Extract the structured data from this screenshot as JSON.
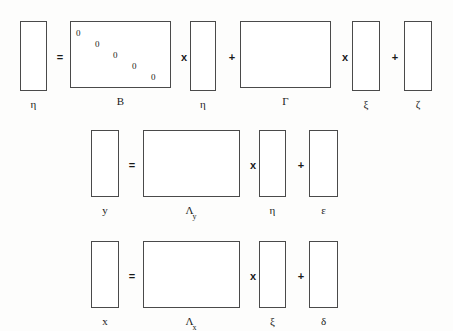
{
  "diagram": {
    "background_color": "#fdfdfc",
    "line_color": "#4a4a4a",
    "text_color": "#1a1a1a",
    "equations": [
      {
        "id": "structural",
        "expression": "η = Bη + Γξ + ζ",
        "terms": [
          {
            "kind": "vector",
            "label": "η",
            "sub": "",
            "x": 20,
            "y": 21,
            "w": 27,
            "h": 70
          },
          {
            "kind": "operator",
            "label": "=",
            "x": 54,
            "y": 52
          },
          {
            "kind": "matrix",
            "label": "B",
            "sub": "",
            "x": 70,
            "y": 21,
            "w": 101,
            "h": 67
          },
          {
            "kind": "operator",
            "label": "x",
            "x": 178,
            "y": 52
          },
          {
            "kind": "vector",
            "label": "η",
            "sub": "",
            "x": 190,
            "y": 21,
            "w": 26,
            "h": 70
          },
          {
            "kind": "operator",
            "label": "+",
            "x": 226,
            "y": 52
          },
          {
            "kind": "matrix",
            "label": "Γ",
            "sub": "",
            "x": 240,
            "y": 21,
            "w": 91,
            "h": 67
          },
          {
            "kind": "operator",
            "label": "x",
            "x": 339,
            "y": 52
          },
          {
            "kind": "vector",
            "label": "ξ",
            "sub": "",
            "x": 352,
            "y": 21,
            "w": 28,
            "h": 70
          },
          {
            "kind": "operator",
            "label": "+",
            "x": 389,
            "y": 52
          },
          {
            "kind": "vector",
            "label": "ζ",
            "sub": "",
            "x": 404,
            "y": 21,
            "w": 28,
            "h": 70
          }
        ],
        "matrix_zeros": {
          "note": "B has a descending diagonal of zeros (no self-influence)",
          "values": [
            "0",
            "0",
            "0",
            "0",
            "0"
          ],
          "positions": [
            {
              "x": 76,
              "y": 29
            },
            {
              "x": 95,
              "y": 40
            },
            {
              "x": 113,
              "y": 51
            },
            {
              "x": 132,
              "y": 62
            },
            {
              "x": 151,
              "y": 73
            }
          ]
        }
      },
      {
        "id": "measurement-y",
        "expression": "y = Λy η + ε",
        "terms": [
          {
            "kind": "vector",
            "label": "y",
            "sub": "",
            "x": 91,
            "y": 130,
            "w": 28,
            "h": 67
          },
          {
            "kind": "operator",
            "label": "=",
            "x": 126,
            "y": 160
          },
          {
            "kind": "matrix",
            "label": "Λ",
            "sub": "y",
            "x": 143,
            "y": 130,
            "w": 97,
            "h": 67
          },
          {
            "kind": "operator",
            "label": "x",
            "x": 247,
            "y": 160
          },
          {
            "kind": "vector",
            "label": "η",
            "sub": "",
            "x": 259,
            "y": 130,
            "w": 27,
            "h": 67
          },
          {
            "kind": "operator",
            "label": "+",
            "x": 295,
            "y": 160
          },
          {
            "kind": "vector",
            "label": "ε",
            "sub": "",
            "x": 309,
            "y": 130,
            "w": 29,
            "h": 67
          }
        ]
      },
      {
        "id": "measurement-x",
        "expression": "x = Λx ξ + δ",
        "terms": [
          {
            "kind": "vector",
            "label": "x",
            "sub": "",
            "x": 91,
            "y": 241,
            "w": 28,
            "h": 67
          },
          {
            "kind": "operator",
            "label": "=",
            "x": 126,
            "y": 271
          },
          {
            "kind": "matrix",
            "label": "Λ",
            "sub": "x",
            "x": 143,
            "y": 241,
            "w": 97,
            "h": 67
          },
          {
            "kind": "operator",
            "label": "x",
            "x": 247,
            "y": 271
          },
          {
            "kind": "vector",
            "label": "ξ",
            "sub": "",
            "x": 259,
            "y": 241,
            "w": 27,
            "h": 67
          },
          {
            "kind": "operator",
            "label": "+",
            "x": 295,
            "y": 271
          },
          {
            "kind": "vector",
            "label": "δ",
            "sub": "",
            "x": 309,
            "y": 241,
            "w": 29,
            "h": 67
          }
        ]
      }
    ]
  }
}
